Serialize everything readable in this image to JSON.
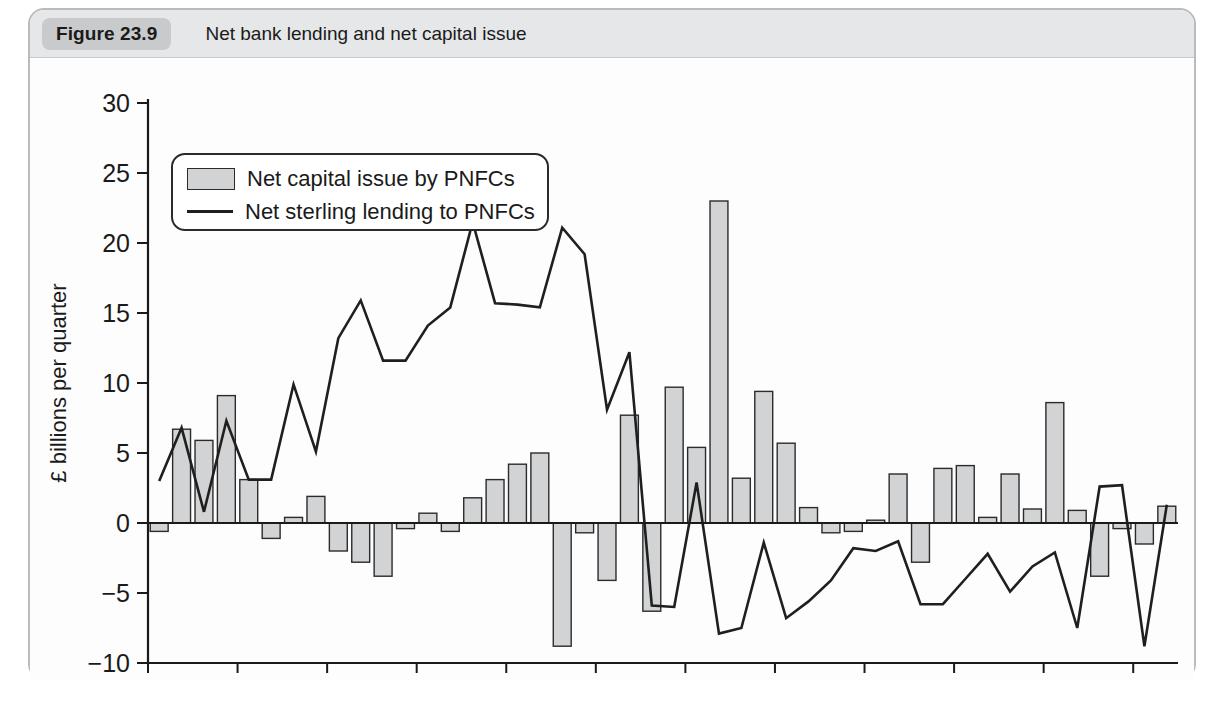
{
  "figure": {
    "badge": "Figure 23.9",
    "title": "Net bank lending and net capital issue"
  },
  "legend": {
    "position": "top-left-inside",
    "items": [
      {
        "label": "Net capital issue by PNFCs",
        "marker": "bar",
        "color": "#d2d3d4"
      },
      {
        "label": "Net sterling lending to PNFCs",
        "marker": "line",
        "color": "#1f1f1f"
      }
    ]
  },
  "axes": {
    "ylabel": "£ billions per quarter",
    "yticks": [
      "30",
      "25",
      "20",
      "15",
      "10",
      "5",
      "0",
      "−5",
      "−10"
    ],
    "xticks": [
      "2003",
      "2004",
      "2005",
      "2006",
      "2007",
      "2008",
      "2009",
      "2010",
      "2011",
      "2012",
      "2013",
      "2014"
    ]
  },
  "chart_data": {
    "type": "bar",
    "title": "Net bank lending and net capital issue",
    "xlabel": "",
    "ylabel": "£ billions per quarter",
    "ylim": [
      -10,
      30
    ],
    "grid": false,
    "legend_position": "upper left",
    "categories": [
      "2003Q1",
      "2003Q2",
      "2003Q3",
      "2003Q4",
      "2004Q1",
      "2004Q2",
      "2004Q3",
      "2004Q4",
      "2005Q1",
      "2005Q2",
      "2005Q3",
      "2005Q4",
      "2006Q1",
      "2006Q2",
      "2006Q3",
      "2006Q4",
      "2007Q1",
      "2007Q2",
      "2007Q3",
      "2007Q4",
      "2008Q1",
      "2008Q2",
      "2008Q3",
      "2008Q4",
      "2009Q1",
      "2009Q2",
      "2009Q3",
      "2009Q4",
      "2010Q1",
      "2010Q2",
      "2010Q3",
      "2010Q4",
      "2011Q1",
      "2011Q2",
      "2011Q3",
      "2011Q4",
      "2012Q1",
      "2012Q2",
      "2012Q3",
      "2012Q4",
      "2013Q1",
      "2013Q2",
      "2013Q3",
      "2013Q4",
      "2014Q1",
      "2014Q2"
    ],
    "series": [
      {
        "name": "Net capital issue by PNFCs",
        "type": "bar",
        "color": "#d2d3d4",
        "values": [
          -0.6,
          6.7,
          5.9,
          9.1,
          3.1,
          -1.1,
          0.4,
          1.9,
          -2.0,
          -2.8,
          -3.8,
          -0.4,
          0.7,
          -0.6,
          1.8,
          3.1,
          4.2,
          5.0,
          -8.8,
          -0.7,
          -4.1,
          7.7,
          -6.3,
          9.7,
          5.4,
          23.0,
          3.2,
          9.4,
          5.7,
          1.1,
          -0.7,
          -0.6,
          0.2,
          3.5,
          -2.8,
          3.9,
          4.1,
          0.4,
          3.5,
          1.0,
          8.6,
          0.9,
          -3.8,
          -0.4,
          -1.5,
          1.2
        ]
      },
      {
        "name": "Net sterling lending to PNFCs",
        "type": "line",
        "color": "#1f1f1f",
        "values": [
          3.0,
          6.8,
          0.8,
          7.3,
          3.1,
          3.1,
          9.9,
          5.1,
          13.2,
          15.9,
          11.6,
          11.6,
          14.1,
          15.4,
          21.5,
          15.7,
          15.6,
          15.4,
          21.1,
          19.2,
          8.1,
          12.2,
          -5.9,
          -6.0,
          2.9,
          -7.9,
          -7.5,
          -1.4,
          -6.8,
          -5.6,
          -4.1,
          -1.8,
          -2.0,
          -1.3,
          -5.8,
          -5.8,
          -4.0,
          -2.2,
          -4.9,
          -3.1,
          -2.1,
          -7.5,
          2.6,
          2.7,
          -8.8,
          1.3
        ]
      }
    ]
  }
}
